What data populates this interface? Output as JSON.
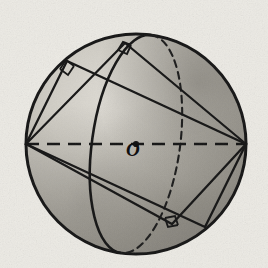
{
  "figure": {
    "type": "geometry-diagram",
    "background_color": "#e9e6df",
    "ink_color": "#1a1a1a",
    "labels": [
      {
        "text": "O",
        "name": "center-label-o",
        "meaning": "center of sphere",
        "x": 137,
        "y": 148
      }
    ],
    "sphere": {
      "name": "sphere-outline",
      "cx": 136,
      "cy": 144,
      "r": 110,
      "stroke": "#141414",
      "stroke_width": 3,
      "fill_light": "#d8d5cd",
      "fill_dark": "#7d7a73"
    },
    "great_circle_ellipse": {
      "name": "great-circle-ellipse",
      "cx": 136,
      "cy": 144,
      "rx": 44,
      "ry": 110,
      "rotation_deg": 8,
      "front_arc_style": "solid",
      "back_arc_style": "dashed"
    },
    "horizontal_diameter": {
      "name": "horizontal-diameter",
      "x1": 26,
      "y1": 144,
      "x2": 246,
      "y2": 144,
      "style": "dashed"
    },
    "vertices": [
      {
        "name": "vertex-left",
        "x": 26,
        "y": 144
      },
      {
        "name": "vertex-right",
        "x": 246,
        "y": 144
      }
    ],
    "right_angle_marks": [
      {
        "name": "right-angle-mark-upper-left",
        "x": 67,
        "y": 61
      },
      {
        "name": "right-angle-mark-top",
        "x": 125,
        "y": 43
      },
      {
        "name": "right-angle-mark-bottom",
        "x": 172,
        "y": 224
      }
    ],
    "rectangles": [
      {
        "name": "rectangle-outer",
        "corners": [
          [
            26,
            144
          ],
          [
            67,
            61
          ],
          [
            246,
            144
          ],
          [
            205,
            227
          ]
        ]
      },
      {
        "name": "rectangle-inner",
        "corners": [
          [
            26,
            144
          ],
          [
            125,
            43
          ],
          [
            246,
            144
          ],
          [
            172,
            224
          ]
        ]
      }
    ]
  }
}
